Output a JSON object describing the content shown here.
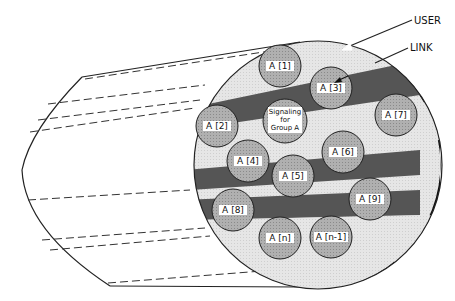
{
  "diagram": {
    "annotations": {
      "user": "USER",
      "link": "LINK"
    },
    "center": {
      "line1": "Signaling",
      "line2": "for",
      "line3": "Group A"
    },
    "users": [
      {
        "id": "a1",
        "label": "A [1]"
      },
      {
        "id": "a2",
        "label": "A [2]"
      },
      {
        "id": "a3",
        "label": "A [3]"
      },
      {
        "id": "a4",
        "label": "A [4]"
      },
      {
        "id": "a5",
        "label": "A [5]"
      },
      {
        "id": "a6",
        "label": "A [6]"
      },
      {
        "id": "a7",
        "label": "A [7]"
      },
      {
        "id": "a8",
        "label": "A [8]"
      },
      {
        "id": "a9",
        "label": "A [9]"
      },
      {
        "id": "an",
        "label": "A [n]"
      },
      {
        "id": "an1",
        "label": "A [n-1]"
      }
    ],
    "colors": {
      "outer_ring": "#111111",
      "light_band": "#e2e2e2",
      "dark_band": "#555555",
      "user_circle": "#a8a8a8",
      "label_bg": "#ffffff"
    }
  }
}
